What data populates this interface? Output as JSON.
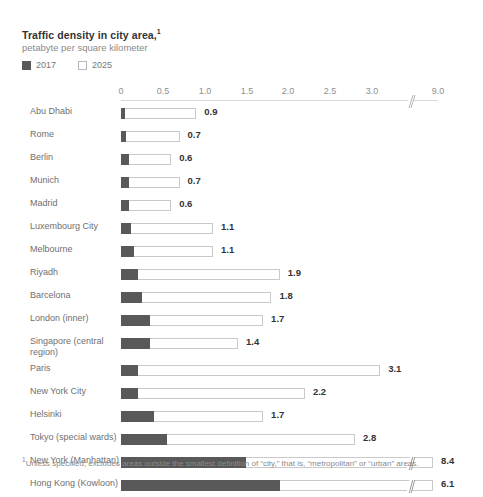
{
  "header": {
    "title": "Traffic density in city area,",
    "title_superscript": "1",
    "subtitle": "petabyte per square kilometer"
  },
  "legend": {
    "items": [
      {
        "label": "2017",
        "style": "dark",
        "color": "#595959"
      },
      {
        "label": "2025",
        "style": "light",
        "color": "#ffffff"
      }
    ]
  },
  "footnote": {
    "marker": "1",
    "text": "Unless specified, excludes areas outside the smallest definition of “city,” that is, “metropolitan” or “urban” areas."
  },
  "axis": {
    "ticks": [
      "0",
      "0.5",
      "1.0",
      "1.5",
      "2.0",
      "2.5",
      "3.0",
      "9.0"
    ],
    "has_break": true,
    "break_after_tick": "3.0"
  },
  "chart_data": {
    "type": "bar",
    "orientation": "horizontal",
    "title": "Traffic density in city area,",
    "subtitle": "petabyte per square kilometer",
    "xlabel": "petabyte per square kilometer",
    "ylabel": "",
    "xlim": [
      0,
      3.3
    ],
    "xticks": [
      0,
      0.5,
      1.0,
      1.5,
      2.0,
      2.5,
      3.0,
      9.0
    ],
    "axis_break": {
      "after": 3.0,
      "resumes_at": 9.0
    },
    "grid": false,
    "legend_position": "top-left",
    "categories": [
      "Abu Dhabi",
      "Rome",
      "Berlin",
      "Munich",
      "Madrid",
      "Luxembourg City",
      "Melbourne",
      "Riyadh",
      "Barcelona",
      "London (inner)",
      "Singapore (central region)",
      "Paris",
      "New York City",
      "Helsinki",
      "Tokyo (special wards)",
      "New York (Manhattan)",
      "Hong Kong (Kowloon)"
    ],
    "series": [
      {
        "name": "2017",
        "color": "#595959",
        "values": [
          0.05,
          0.06,
          0.09,
          0.09,
          0.09,
          0.12,
          0.15,
          0.2,
          0.25,
          0.35,
          0.35,
          0.2,
          0.2,
          0.4,
          0.55,
          1.5,
          1.9
        ]
      },
      {
        "name": "2025",
        "color": "#ffffff",
        "values": [
          0.9,
          0.7,
          0.6,
          0.7,
          0.6,
          1.1,
          1.1,
          1.9,
          1.8,
          1.7,
          1.4,
          3.1,
          2.2,
          1.7,
          2.8,
          8.4,
          6.1
        ]
      }
    ],
    "data_labels": [
      "0.9",
      "0.7",
      "0.6",
      "0.7",
      "0.6",
      "1.1",
      "1.1",
      "1.9",
      "1.8",
      "1.7",
      "1.4",
      "3.1",
      "2.2",
      "1.7",
      "2.8",
      "8.4",
      "6.1"
    ],
    "broken_bars": [
      "New York (Manhattan)",
      "Hong Kong (Kowloon)"
    ]
  }
}
